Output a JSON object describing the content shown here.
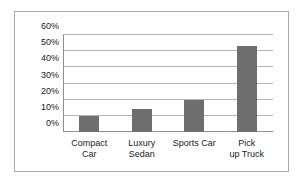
{
  "chart_data": {
    "type": "bar",
    "title": "",
    "xlabel": "",
    "ylabel": "",
    "categories": [
      "Compact Car",
      "Luxury Sedan",
      "Sports Car",
      "Pick up Truck"
    ],
    "values": [
      10,
      14.5,
      20,
      53
    ],
    "ylim": [
      0,
      60
    ],
    "ytick_labels": [
      "0%",
      "10%",
      "20%",
      "30%",
      "40%",
      "50%",
      "60%"
    ],
    "ytick_values": [
      0,
      10,
      20,
      30,
      40,
      50,
      60
    ],
    "grid": true,
    "legend": "none",
    "bar_color": "#6e6e6e",
    "gridline_color": "#b5b5b5",
    "axis_color": "#8f8f8f",
    "frame_color": "#a8a8a8",
    "background_color": "#ffffff"
  }
}
